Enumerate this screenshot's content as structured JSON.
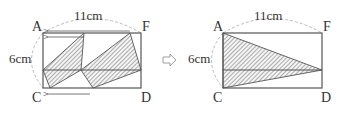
{
  "figure": {
    "left_panel": {
      "vertices": {
        "top_left": "A",
        "top_right": "F",
        "bottom_left": "C",
        "bottom_right": "D"
      },
      "width_label": "11cm",
      "height_label": "6cm"
    },
    "transition_arrow": "⇨",
    "right_panel": {
      "vertices": {
        "top_left": "A",
        "top_right": "F",
        "bottom_left": "C",
        "bottom_right": "D"
      },
      "width_label": "11cm",
      "height_label": "6cm"
    },
    "colors": {
      "line": "#555555",
      "hatch": "#666666",
      "dashed_arc": "#aaaaaa",
      "text": "#333333"
    }
  }
}
